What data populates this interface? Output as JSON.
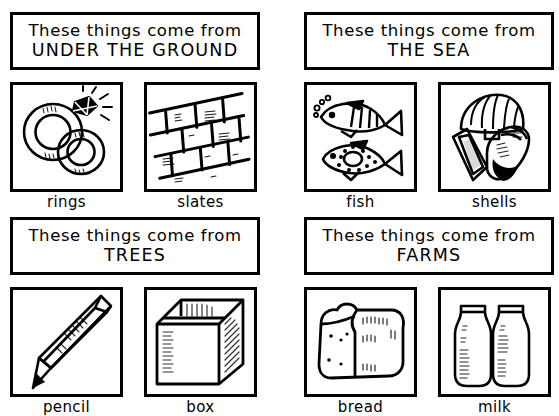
{
  "worksheet": {
    "title": "These things come from",
    "panels": [
      {
        "id": "under-the-ground",
        "heading_line1": "These things come from",
        "heading_line2": "UNDER THE GROUND",
        "items": [
          {
            "label": "rings",
            "icon": "rings-icon"
          },
          {
            "label": "slates",
            "icon": "slates-icon"
          }
        ]
      },
      {
        "id": "the-sea",
        "heading_line1": "These things come from",
        "heading_line2": "THE SEA",
        "items": [
          {
            "label": "fish",
            "icon": "fish-icon"
          },
          {
            "label": "shells",
            "icon": "shells-icon"
          }
        ]
      },
      {
        "id": "trees",
        "heading_line1": "These things come from",
        "heading_line2": "TREES",
        "items": [
          {
            "label": "pencil",
            "icon": "pencil-icon"
          },
          {
            "label": "box",
            "icon": "box-icon"
          }
        ]
      },
      {
        "id": "farms",
        "heading_line1": "These things come from",
        "heading_line2": "FARMS",
        "items": [
          {
            "label": "bread",
            "icon": "bread-icon"
          },
          {
            "label": "milk",
            "icon": "milk-icon"
          }
        ]
      }
    ],
    "colors": {
      "ink": "#000000",
      "paper": "#ffffff"
    }
  }
}
